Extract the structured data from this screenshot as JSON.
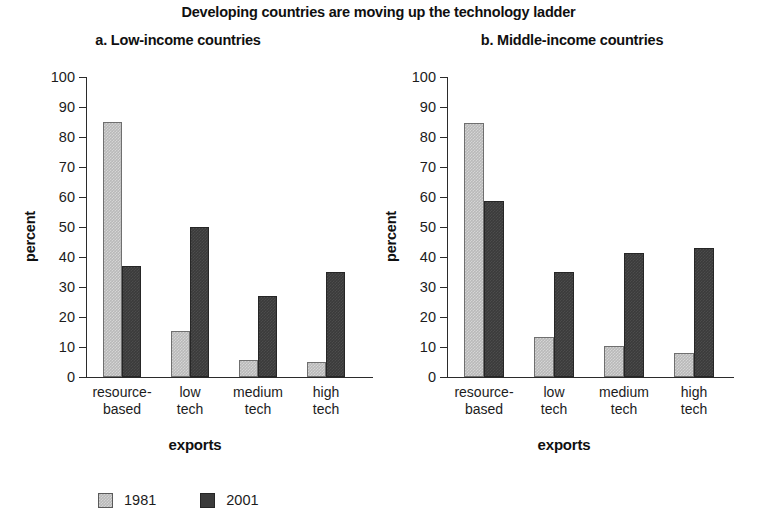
{
  "chart_data": {
    "type": "bar",
    "title": "Developing countries are moving up the technology ladder",
    "categories": [
      "resource-based",
      "low tech",
      "medium tech",
      "high tech"
    ],
    "legend_position": "bottom-left",
    "grid": false,
    "panels": [
      {
        "id": "a",
        "title": "a. Low-income countries",
        "xlabel": "exports",
        "ylabel": "percent",
        "ylim": [
          0,
          100
        ],
        "yticks": [
          0,
          10,
          20,
          30,
          40,
          50,
          60,
          70,
          80,
          90,
          100
        ],
        "categories": [
          "resource-based",
          "low tech",
          "medium tech",
          "high tech"
        ],
        "series": [
          {
            "name": "1981",
            "color": "#b9b9b9",
            "values": [
              85,
              15.5,
              5.8,
              5
            ]
          },
          {
            "name": "2001",
            "color": "#3b3b3b",
            "values": [
              37,
              50,
              27,
              35
            ]
          }
        ]
      },
      {
        "id": "b",
        "title": "b. Middle-income countries",
        "xlabel": "exports",
        "ylabel": "percent",
        "ylim": [
          0,
          100
        ],
        "yticks": [
          0,
          10,
          20,
          30,
          40,
          50,
          60,
          70,
          80,
          90,
          100
        ],
        "categories": [
          "resource-based",
          "low tech",
          "medium tech",
          "high tech"
        ],
        "series": [
          {
            "name": "1981",
            "color": "#b9b9b9",
            "values": [
              84.7,
              13.4,
              10.3,
              8
            ]
          },
          {
            "name": "2001",
            "color": "#3b3b3b",
            "values": [
              58.7,
              35,
              41.5,
              43
            ]
          }
        ]
      }
    ],
    "legend": [
      {
        "label": "1981",
        "color": "#b9b9b9"
      },
      {
        "label": "2001",
        "color": "#3b3b3b"
      }
    ]
  },
  "figure": {
    "title": "Developing countries are moving up the technology ladder",
    "panel_a": {
      "title": "a. Low-income countries",
      "ylabel": "percent",
      "xlabel": "exports",
      "yticks": [
        "100",
        "90",
        "80",
        "70",
        "60",
        "50",
        "40",
        "30",
        "20",
        "10",
        "0"
      ],
      "cat_lines": [
        {
          "line1": "resource-",
          "line2": "based"
        },
        {
          "line1": "low",
          "line2": "tech"
        },
        {
          "line1": "medium",
          "line2": "tech"
        },
        {
          "line1": "high",
          "line2": "tech"
        }
      ]
    },
    "panel_b": {
      "title": "b. Middle-income countries",
      "ylabel": "percent",
      "xlabel": "exports",
      "yticks": [
        "100",
        "90",
        "80",
        "70",
        "60",
        "50",
        "40",
        "30",
        "20",
        "10",
        "0"
      ],
      "cat_lines": [
        {
          "line1": "resource-",
          "line2": "based"
        },
        {
          "line1": "low",
          "line2": "tech"
        },
        {
          "line1": "medium",
          "line2": "tech"
        },
        {
          "line1": "high",
          "line2": "tech"
        }
      ]
    },
    "legend": [
      {
        "label": "1981"
      },
      {
        "label": "2001"
      }
    ]
  }
}
